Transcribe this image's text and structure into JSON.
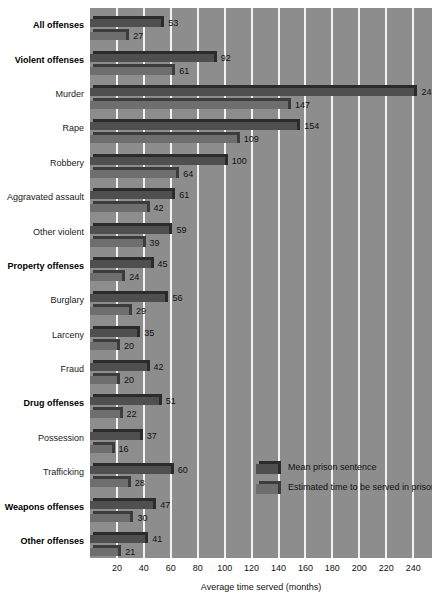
{
  "chart_data": {
    "type": "bar",
    "orientation": "horizontal",
    "title": "",
    "xlabel": "Average time served (months)",
    "ylabel": "",
    "xlim": [
      0,
      254
    ],
    "xticks": [
      20,
      40,
      60,
      80,
      100,
      120,
      140,
      160,
      180,
      200,
      220,
      240
    ],
    "grid": true,
    "legend_position": "inside-right",
    "categories": [
      "All offenses",
      "Violent offenses",
      "Murder",
      "Rape",
      "Robbery",
      "Aggravated assault",
      "Other violent",
      "Property offenses",
      "Burglary",
      "Larceny",
      "Fraud",
      "Drug offenses",
      "Possession",
      "Trafficking",
      "Weapons offenses",
      "Other offenses"
    ],
    "category_emphasis": [
      true,
      true,
      false,
      false,
      false,
      false,
      false,
      true,
      false,
      false,
      false,
      true,
      false,
      false,
      true,
      true
    ],
    "series": [
      {
        "name": "Mean prison sentence",
        "color": "#4f4f4f",
        "values": [
          53,
          92,
          241,
          154,
          100,
          61,
          59,
          45,
          56,
          35,
          42,
          51,
          37,
          60,
          47,
          41
        ]
      },
      {
        "name": "Estimated time to be served in prison",
        "color": "#6e6e6e",
        "values": [
          27,
          61,
          147,
          109,
          64,
          42,
          39,
          24,
          29,
          20,
          20,
          22,
          16,
          28,
          30,
          21
        ]
      }
    ]
  },
  "colors": {
    "plot_background": "#8d8d8d",
    "gridline": "#f2f2f2",
    "page_background": "#ffffff",
    "mean_bar": "#4f4f4f",
    "estimated_bar": "#6e6e6e",
    "text": "#111111"
  }
}
